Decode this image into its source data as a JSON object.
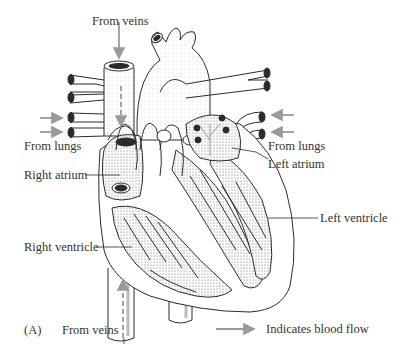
{
  "figure": {
    "panel_label": "(A)",
    "colors": {
      "line": "#2b2b2b",
      "arrow": "#9a9a9a",
      "background": "#ffffff"
    }
  },
  "labels": {
    "from_veins_top": "From veins",
    "from_lungs_left": "From lungs",
    "from_lungs_right": "From lungs",
    "left_atrium": "Left atrium",
    "right_atrium": "Right atrium",
    "left_ventricle": "Left ventricle",
    "right_ventricle": "Right ventricle",
    "from_veins_bottom": "From veins"
  },
  "legend": {
    "icon": "arrow-right-icon",
    "text": "Indicates blood flow"
  }
}
